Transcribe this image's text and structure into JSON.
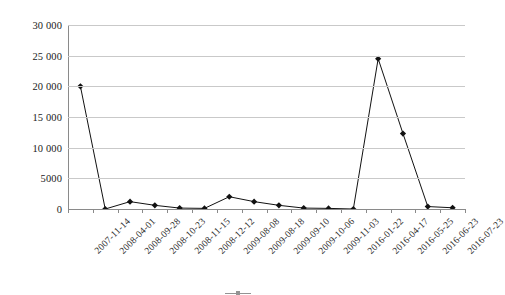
{
  "chart_data": {
    "type": "line",
    "title": "",
    "subtitle": "",
    "xlabel": "",
    "ylabel": "",
    "ylim": [
      0,
      30000
    ],
    "yticks": [
      0,
      5000,
      10000,
      15000,
      20000,
      25000,
      30000
    ],
    "ytick_labels": [
      "0",
      "5000",
      "10 000",
      "15 000",
      "20 000",
      "25 000",
      "30 000"
    ],
    "grid": true,
    "legend_position": "bottom",
    "marker": "filled-diamond",
    "line_color": "#111111",
    "grid_color": "#c9c9c9",
    "axis_color": "#8a8a8a",
    "categories": [
      "2007-11-14",
      "2008-04-01",
      "2008-09-28",
      "2008-10-23",
      "2008-11-15",
      "2008-12-12",
      "2009-08-08",
      "2009-08-18",
      "2009-09-10",
      "2009-10-06",
      "2009-11-03",
      "2016-01-22",
      "2016-04-17",
      "2016-05-25",
      "2016-06-23",
      "2016-07-23"
    ],
    "series": [
      {
        "name": "",
        "values": [
          20000,
          0,
          1200,
          600,
          150,
          100,
          2000,
          1200,
          600,
          150,
          100,
          0,
          24500,
          12300,
          400,
          200
        ]
      }
    ]
  },
  "caption": {
    "legend_label": "",
    "text": ""
  }
}
